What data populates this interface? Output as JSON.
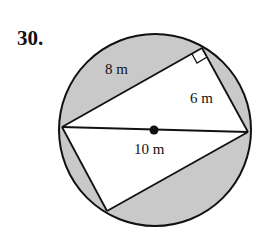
{
  "problem": {
    "number": "30."
  },
  "diagram": {
    "circle": {
      "cx": 155,
      "cy": 130,
      "r": 96
    },
    "points": {
      "left": [
        62,
        127
      ],
      "right": [
        248,
        132
      ],
      "top_right_angle": [
        202,
        48
      ],
      "bottom": [
        107,
        211
      ],
      "center": [
        154,
        130
      ]
    },
    "labels": {
      "side_a": "8 m",
      "side_b": "6 m",
      "diameter": "10 m"
    },
    "colors": {
      "shade": "#c9c9c9",
      "stroke": "#111111",
      "background": "#ffffff"
    }
  }
}
